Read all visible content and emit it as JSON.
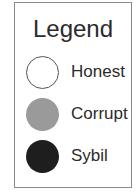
{
  "legend": {
    "title": "Legend",
    "items": [
      {
        "label": "Honest",
        "fill": "#ffffff",
        "stroke": "#555555"
      },
      {
        "label": "Corrupt",
        "fill": "#9a9a9a",
        "stroke": "#9a9a9a"
      },
      {
        "label": "Sybil",
        "fill": "#1e1e1e",
        "stroke": "#1e1e1e"
      }
    ]
  }
}
